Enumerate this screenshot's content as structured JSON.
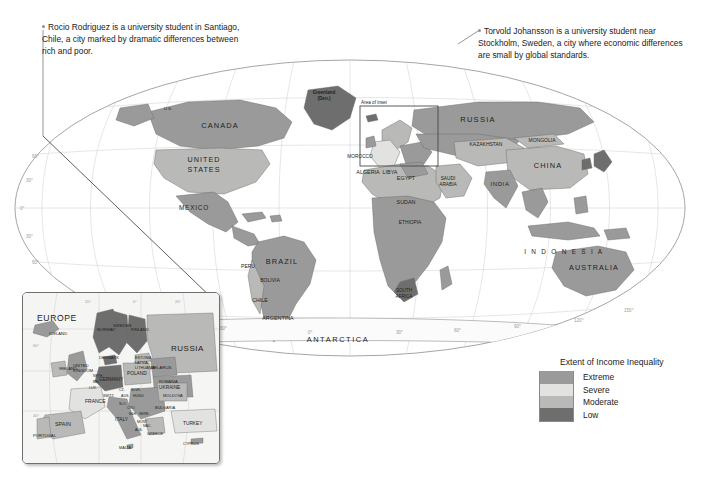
{
  "annotations": [
    {
      "id": "rocio",
      "marker": "callout-dot-icon",
      "text": "Rocio Rodriguez is a university student in Santiago, Chile, a city marked by dramatic differences between rich and poor."
    },
    {
      "id": "torvold",
      "marker": "callout-dot-icon",
      "text": "Torvold Johansson is a university student near Stockholm, Sweden, a city where economic differences are small by global standards."
    }
  ],
  "legend": {
    "title": "Extent of Income Inequality",
    "items": [
      {
        "label": "Extreme",
        "color": "#9a9a9a"
      },
      {
        "label": "Severe",
        "color": "#e2e2e0"
      },
      {
        "label": "Moderate",
        "color": "#b9b9b7"
      },
      {
        "label": "Low",
        "color": "#6e6e6e"
      }
    ]
  },
  "inset": {
    "title": "EUROPE",
    "area_label": "Area of inset",
    "labels": [
      "ICELAND",
      "NORWAY",
      "SWEDEN",
      "FINLAND",
      "RUSSIA",
      "ESTONIA",
      "LATVIA",
      "LITHUANIA",
      "DENMARK",
      "IRELAND",
      "UNITED KINGDOM",
      "NETH.",
      "BEL.",
      "GERMANY",
      "POLAND",
      "BELARUS",
      "UKRAINE",
      "CZECH REP.",
      "SLOVAKIA",
      "AUSTRIA",
      "HUNGARY",
      "MOLDOVA",
      "ROMANIA",
      "SLOVENIA",
      "CROATIA",
      "BOS. & HERZ.",
      "SERBIA",
      "MONT.",
      "KOS.",
      "MAC.",
      "BULGARIA",
      "ALBANIA",
      "GREECE",
      "ITALY",
      "SWITZ.",
      "LUX.",
      "FRANCE",
      "SPAIN",
      "PORTUGAL",
      "TURKEY",
      "MALTA",
      "CYPRUS"
    ],
    "graticule": [
      "20°",
      "0°",
      "20°",
      "40°",
      "60°",
      "60°",
      "40°"
    ]
  },
  "map": {
    "continents": [
      "CANADA",
      "UNITED STATES",
      "RUSSIA",
      "CHINA",
      "BRAZIL",
      "AUSTRALIA",
      "ANTARCTICA",
      "INDONESIA"
    ],
    "area_of_inset_label": "Area of inset",
    "labels": [
      "U.S.",
      "CANADA",
      "UNITED STATES",
      "MEXICO",
      "BELIZE",
      "GUATEMALA",
      "EL SALVADOR",
      "HONDURAS",
      "NICARAGUA",
      "COSTA RICA",
      "PANAMA",
      "CUBA",
      "BAHAMAS",
      "JAMAICA",
      "HAITI",
      "DOM. REP.",
      "Puerto Rico (U.S.)",
      "ST. KITTS & NEVIS",
      "ANTIGUA & BARBUDA",
      "DOMINICA",
      "ST. LUCIA",
      "BARBADOS",
      "ST. VINCENT & THE GRENADINES",
      "GRENADA",
      "TRINIDAD & TOBAGO",
      "COLOMBIA",
      "VENEZUELA",
      "GUYANA",
      "SURINAME",
      "French Guiana (Fr.)",
      "ECUADOR",
      "PERU",
      "BRAZIL",
      "BOLIVIA",
      "PARAGUAY",
      "CHILE",
      "ARGENTINA",
      "URUGUAY",
      "Greenland (Den.)",
      "ICELAND",
      "NORWAY",
      "SWEDEN",
      "FINLAND",
      "IRELAND",
      "U.K.",
      "PORTUGAL",
      "SPAIN",
      "FRANCE",
      "ITALY",
      "GERMANY",
      "POLAND",
      "UKRAINE",
      "RUSSIA",
      "MOROCCO",
      "Western Sahara",
      "ALGERIA",
      "TUNISIA",
      "LIBYA",
      "EGYPT",
      "MAURITANIA",
      "MALI",
      "NIGER",
      "CHAD",
      "SUDAN",
      "ERITREA",
      "DJIBOUTI",
      "ETHIOPIA",
      "SOMALIA",
      "SENEGAL",
      "GAMBIA",
      "GUINEA-BISSAU",
      "GUINEA",
      "SIERRA LEONE",
      "LIBERIA",
      "CÔTE D'IVOIRE",
      "BURKINA FASO",
      "GHANA",
      "TOGO",
      "BENIN",
      "NIGERIA",
      "CAMEROON",
      "EQ. GUINEA",
      "SAO TOME & PRINCIPE",
      "GABON",
      "REP. OF THE CONGO",
      "DEM. REP. OF THE CONGO",
      "C.A.R.",
      "UGANDA",
      "KENYA",
      "RWANDA",
      "BURUNDI",
      "TANZANIA",
      "ANGOLA",
      "ZAMBIA",
      "MALAWI",
      "MOZAMBIQUE",
      "ZIMBABWE",
      "BOTSWANA",
      "NAMIBIA",
      "SOUTH AFRICA",
      "LESOTHO",
      "SWAZILAND",
      "MADAGASCAR",
      "MAURITIUS",
      "SEYCHELLES",
      "COMOROS",
      "TURKEY",
      "SYRIA",
      "LEBANON",
      "ISRAEL",
      "JORDAN",
      "IRAQ",
      "IRAN",
      "KUWAIT",
      "SAUDI ARABIA",
      "BAHRAIN",
      "QATAR",
      "U.A.E.",
      "OMAN",
      "YEMEN",
      "GEORGIA",
      "ARMENIA",
      "AZERBAIJAN",
      "KAZAKHSTAN",
      "UZBEKISTAN",
      "TURKMENISTAN",
      "KYRGYZSTAN",
      "TAJIKISTAN",
      "AFGHANISTAN",
      "PAKISTAN",
      "INDIA",
      "NEPAL",
      "BHUTAN",
      "BANGLADESH",
      "SRI LANKA",
      "MALDIVES",
      "MONGOLIA",
      "CHINA",
      "NORTH KOREA",
      "SOUTH KOREA",
      "JAPAN",
      "TAIWAN",
      "MYANMAR",
      "THAILAND",
      "LAOS",
      "VIETNAM",
      "CAMBODIA",
      "MALAYSIA",
      "SINGAPORE",
      "BRUNEI",
      "PHILIPPINES",
      "INDONESIA",
      "EAST TIMOR",
      "PAPUA NEW GUINEA",
      "AUSTRALIA",
      "NEW ZEALAND",
      "FIJI",
      "VANUATU",
      "SOLOMON IS.",
      "New Caledonia (Fr.)",
      "PALAU",
      "FEDERATED STATES OF MICRONESIA",
      "MARSHALL ISLANDS",
      "NAURU",
      "KIRIBATI",
      "SAMOA",
      "TONGA",
      "ANTARCTICA"
    ],
    "graticule_lat": [
      "60°",
      "30°",
      "0°",
      "30°",
      "60°"
    ],
    "graticule_lon": [
      "120°",
      "60°",
      "0°",
      "60°",
      "120°",
      "150°",
      "30°",
      "90°"
    ]
  },
  "colors": {
    "extreme": "#9a9a9a",
    "severe": "#e2e2e0",
    "moderate": "#b9b9b7",
    "low": "#6e6e6e",
    "ocean": "#ffffff",
    "graticule": "#cfcfcf",
    "outline": "#6b6b6b",
    "text": "#231f20"
  }
}
